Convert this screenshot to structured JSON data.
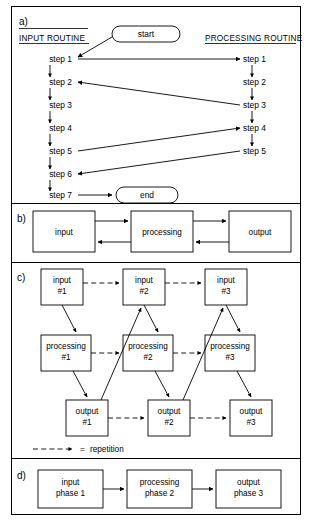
{
  "figure": {
    "panels": [
      {
        "id": "a",
        "label": "a)",
        "headings": {
          "left": "INPUT ROUTINE",
          "right": "PROCESSING ROUTINE"
        },
        "terminators": {
          "start": "start",
          "end": "end"
        },
        "left_steps": [
          "step 1",
          "step 2",
          "step 3",
          "step 4",
          "step 5",
          "step 6",
          "step 7"
        ],
        "right_steps": [
          "step 1",
          "step 2",
          "step 3",
          "step 4",
          "step 5"
        ],
        "cross_links": [
          {
            "from": "left step 1",
            "to": "right step 1",
            "direction": "right"
          },
          {
            "from": "right step 3",
            "to": "left step 2",
            "direction": "left"
          },
          {
            "from": "left step 5",
            "to": "right step 4",
            "direction": "right"
          },
          {
            "from": "right step 5",
            "to": "left step 6",
            "direction": "left"
          },
          {
            "from": "start",
            "to": "left step 1",
            "direction": "left"
          },
          {
            "from": "left step 7",
            "to": "end",
            "direction": "right"
          }
        ]
      },
      {
        "id": "b",
        "label": "b)",
        "boxes": [
          "input",
          "processing",
          "output"
        ],
        "links": [
          {
            "between": "input-processing",
            "type": "bidirectional"
          },
          {
            "between": "processing-output",
            "type": "bidirectional"
          }
        ]
      },
      {
        "id": "c",
        "label": "c)",
        "rows": {
          "input": [
            {
              "line1": "input",
              "line2": "#1"
            },
            {
              "line1": "input",
              "line2": "#2"
            },
            {
              "line1": "input",
              "line2": "#3"
            }
          ],
          "processing": [
            {
              "line1": "processing",
              "line2": "#1"
            },
            {
              "line1": "processing",
              "line2": "#2"
            },
            {
              "line1": "processing",
              "line2": "#3"
            }
          ],
          "output": [
            {
              "line1": "output",
              "line2": "#1"
            },
            {
              "line1": "output",
              "line2": "#2"
            },
            {
              "line1": "output",
              "line2": "#3"
            }
          ]
        },
        "legend": {
          "symbol": "dashed-arrow",
          "equals": "=",
          "text": "repetition"
        }
      },
      {
        "id": "d",
        "label": "d)",
        "boxes": [
          {
            "line1": "input",
            "line2": "phase 1"
          },
          {
            "line1": "processing",
            "line2": "phase 2"
          },
          {
            "line1": "output",
            "line2": "phase 3"
          }
        ]
      }
    ]
  },
  "colors": {
    "ink": "#000000",
    "paper": "#ffffff"
  }
}
